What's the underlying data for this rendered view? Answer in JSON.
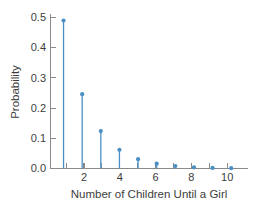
{
  "chart_data": {
    "type": "bar",
    "title": "",
    "xlabel": "Number of Children Until a Girl",
    "ylabel": "Probability",
    "categories": [
      1,
      2,
      3,
      4,
      5,
      6,
      7,
      8,
      9,
      10
    ],
    "values": [
      0.49,
      0.246,
      0.124,
      0.062,
      0.031,
      0.016,
      0.008,
      0.004,
      0.002,
      0.001
    ],
    "xlim": [
      0.3,
      10.9
    ],
    "ylim": [
      0.0,
      0.5
    ],
    "xticks": [
      1,
      2,
      3,
      4,
      5,
      6,
      7,
      8,
      9,
      10
    ],
    "xtick_labels": [
      "",
      "2",
      "",
      "4",
      "",
      "6",
      "",
      "8",
      "",
      "10"
    ],
    "yticks": [
      0.0,
      0.1,
      0.2,
      0.3,
      0.4,
      0.5
    ],
    "ytick_labels": [
      "0.0",
      "0.1",
      "0.2",
      "0.3",
      "0.4",
      "0.5"
    ],
    "grid": false,
    "legend": false,
    "series_color": "#4a90c4",
    "marker": "circle"
  },
  "axis": {
    "y_label": "Probability",
    "x_label": "Number of Children Until a Girl",
    "y_tick_0": "0.0",
    "y_tick_1": "0.1",
    "y_tick_2": "0.2",
    "y_tick_3": "0.3",
    "y_tick_4": "0.4",
    "y_tick_5": "0.5",
    "x_tick_2": "2",
    "x_tick_4": "4",
    "x_tick_6": "6",
    "x_tick_8": "8",
    "x_tick_10": "10"
  },
  "colors": {
    "series": "#4a90c4",
    "axis": "#8a8a8a",
    "text": "#3d3d3d",
    "background": "#ffffff"
  }
}
